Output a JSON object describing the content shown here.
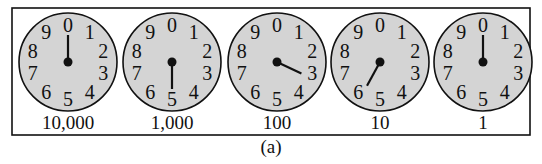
{
  "figure": {
    "caption": "(a)",
    "border": {
      "x": 12,
      "y": 8,
      "width": 518,
      "height": 127
    },
    "dial_numbers": [
      "0",
      "1",
      "2",
      "3",
      "4",
      "5",
      "6",
      "7",
      "8",
      "9"
    ],
    "colors": {
      "face": "#d4d4d4",
      "ink": "#111111",
      "background": "#ffffff"
    },
    "dials": [
      {
        "label": "10,000",
        "reading": 0,
        "cx": 68,
        "cy": 62
      },
      {
        "label": "1,000",
        "reading": 5,
        "cx": 172,
        "cy": 62
      },
      {
        "label": "100",
        "reading": 3.2,
        "cx": 277,
        "cy": 62
      },
      {
        "label": "10",
        "reading": 5.8,
        "cx": 380,
        "cy": 62
      },
      {
        "label": "1",
        "reading": 0,
        "cx": 483,
        "cy": 62
      }
    ]
  }
}
